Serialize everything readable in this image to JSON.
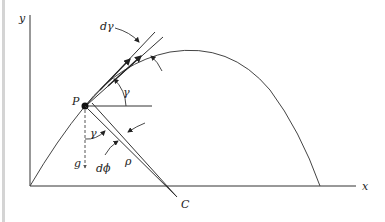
{
  "figure": {
    "type": "projectile trajectory diagram",
    "labels": {
      "y_axis": "y",
      "x_axis": "x",
      "point": "P",
      "d_gamma": "dγ",
      "gamma_top": "γ",
      "gamma_bottom": "γ",
      "gravity": "g",
      "d_phi": "dϕ",
      "rho": "ρ",
      "center": "C"
    },
    "colors": {
      "stroke": "#333333",
      "background": "#ffffff",
      "left_bar": "#d4d4d4"
    }
  }
}
